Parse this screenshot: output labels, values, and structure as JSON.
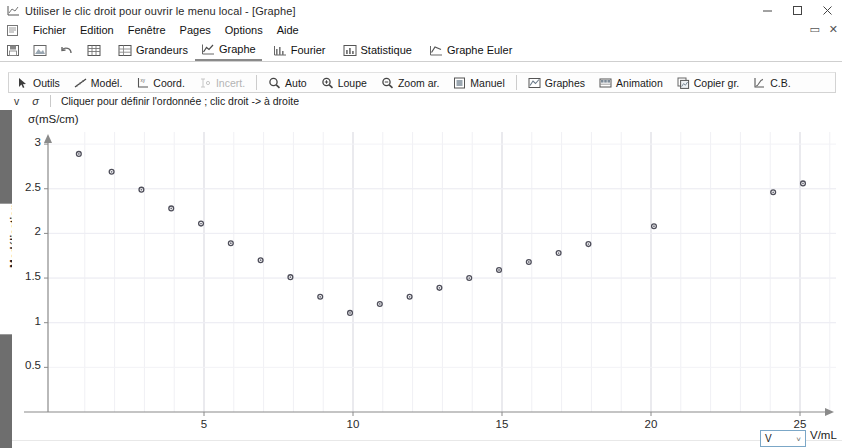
{
  "window": {
    "title": "Utiliser le clic droit pour ouvrir le menu local - [Graphe]",
    "icon": "app-graph-icon",
    "minimize": "–",
    "maximize": "▢",
    "close": "✕",
    "doc_restore": "▭",
    "doc_close": "✕"
  },
  "menubar": {
    "icon": "document-icon",
    "items": [
      {
        "label": "Fichier"
      },
      {
        "label": "Edition"
      },
      {
        "label": "Fenêtre"
      },
      {
        "label": "Pages"
      },
      {
        "label": "Options"
      },
      {
        "label": "Aide"
      }
    ]
  },
  "ribbon": {
    "icon_buttons": [
      {
        "name": "save-icon",
        "label": ""
      },
      {
        "name": "image-icon",
        "label": ""
      },
      {
        "name": "undo-icon",
        "label": ""
      },
      {
        "name": "table-icon",
        "label": ""
      }
    ],
    "tabs": [
      {
        "label": "Grandeurs",
        "icon": "table-grid-icon",
        "active": false
      },
      {
        "label": "Graphe",
        "icon": "chart-line-icon",
        "active": true
      },
      {
        "label": "Fourier",
        "icon": "bars-icon",
        "active": false
      },
      {
        "label": "Statistique",
        "icon": "histogram-icon",
        "active": false
      },
      {
        "label": "Graphe Euler",
        "icon": "euler-chart-icon",
        "active": false
      }
    ]
  },
  "toolbar": {
    "buttons": [
      {
        "label": "Outils",
        "icon": "cursor-icon",
        "disabled": false
      },
      {
        "label": "Modél.",
        "icon": "model-curve-icon",
        "disabled": false
      },
      {
        "label": "Coord.",
        "icon": "coord-icon",
        "disabled": false
      },
      {
        "label": "Incert.",
        "icon": "errorbar-icon",
        "disabled": true
      },
      {
        "label": "Auto",
        "icon": "magnifier-icon",
        "disabled": false
      },
      {
        "label": "Loupe",
        "icon": "loupe-icon",
        "disabled": false
      },
      {
        "label": "Zoom ar.",
        "icon": "zoom-out-icon",
        "disabled": false
      },
      {
        "label": "Manuel",
        "icon": "manual-icon",
        "disabled": false
      },
      {
        "label": "Graphes",
        "icon": "graphs-icon",
        "disabled": false
      },
      {
        "label": "Animation",
        "icon": "animation-icon",
        "disabled": false
      },
      {
        "label": "Copier gr.",
        "icon": "copy-graph-icon",
        "disabled": false
      },
      {
        "label": "C.B.",
        "icon": "cb-icon",
        "disabled": false
      }
    ]
  },
  "hintbar": {
    "v_label": "v",
    "sigma_label": "σ",
    "message": "Cliquer pour définir l'ordonnée ; clic droit -> à droite"
  },
  "left_rail": {
    "tab_label": "Modélisation"
  },
  "unit_selector": {
    "value": "V",
    "chevron": "˅",
    "label": "V/mL"
  },
  "chart_data": {
    "type": "scatter",
    "title": "",
    "ylabel": "σ(mS/cm)",
    "xlabel": "V/mL",
    "xlim": [
      0,
      26
    ],
    "ylim": [
      0,
      3.15
    ],
    "xticks": [
      5,
      10,
      15,
      20,
      25
    ],
    "yticks": [
      0.5,
      1,
      1.5,
      2,
      2.5,
      3
    ],
    "grid": true,
    "marker": "open-circle",
    "series": [
      {
        "name": "conductivité",
        "points": [
          {
            "x": 0.8,
            "y": 2.89
          },
          {
            "x": 1.9,
            "y": 2.69
          },
          {
            "x": 2.9,
            "y": 2.49
          },
          {
            "x": 3.9,
            "y": 2.28
          },
          {
            "x": 4.9,
            "y": 2.11
          },
          {
            "x": 5.9,
            "y": 1.89
          },
          {
            "x": 6.9,
            "y": 1.7
          },
          {
            "x": 7.9,
            "y": 1.51
          },
          {
            "x": 8.9,
            "y": 1.29
          },
          {
            "x": 9.9,
            "y": 1.11
          },
          {
            "x": 10.9,
            "y": 1.21
          },
          {
            "x": 11.9,
            "y": 1.29
          },
          {
            "x": 12.9,
            "y": 1.39
          },
          {
            "x": 13.9,
            "y": 1.5
          },
          {
            "x": 14.9,
            "y": 1.59
          },
          {
            "x": 15.9,
            "y": 1.68
          },
          {
            "x": 16.9,
            "y": 1.78
          },
          {
            "x": 17.9,
            "y": 1.88
          },
          {
            "x": 20.1,
            "y": 2.08
          },
          {
            "x": 24.1,
            "y": 2.46
          },
          {
            "x": 25.1,
            "y": 2.56
          }
        ]
      }
    ]
  }
}
